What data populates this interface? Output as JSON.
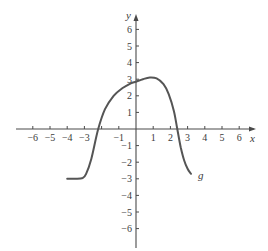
{
  "chart_data": {
    "type": "line",
    "title": "",
    "xlabel": "x",
    "ylabel": "y",
    "xlim": [
      -6.5,
      6.8
    ],
    "ylim": [
      -7,
      7
    ],
    "grid": false,
    "x_ticks": [
      -6,
      -5,
      -4,
      -3,
      -1,
      1,
      2,
      3,
      4,
      5,
      6
    ],
    "x_tick_labels": [
      "−6",
      "−5",
      "−4",
      "−3",
      "−1",
      "1",
      "2",
      "3",
      "4",
      "5",
      "6"
    ],
    "y_ticks": [
      6,
      5,
      4,
      3,
      2,
      1,
      -1,
      -2,
      -3,
      -4,
      -5,
      -6
    ],
    "y_tick_labels": [
      "6",
      "5",
      "4",
      "3",
      "2",
      "1",
      "−1",
      "−2",
      "−3",
      "−4",
      "−5",
      "−6"
    ],
    "series": [
      {
        "name": "g",
        "x": [
          -4,
          -3.5,
          -3.1,
          -2.9,
          -2.6,
          -2.2,
          -1.8,
          -1.3,
          -0.8,
          -0.3,
          0,
          0.4,
          0.8,
          1.2,
          1.6,
          1.9,
          2.2,
          2.4,
          2.6,
          2.8,
          3.0,
          3.2
        ],
        "values": [
          -3,
          -3,
          -2.95,
          -2.7,
          -1.8,
          0,
          1.2,
          2.0,
          2.45,
          2.75,
          2.85,
          3.0,
          3.1,
          3.05,
          2.7,
          2.1,
          1.1,
          0,
          -1.1,
          -1.9,
          -2.4,
          -2.7
        ]
      }
    ],
    "annotations": [
      {
        "text": "g",
        "x": 3.6,
        "y": -2.8
      }
    ]
  },
  "labels": {
    "x_axis": "x",
    "y_axis": "y",
    "curve": "g"
  }
}
